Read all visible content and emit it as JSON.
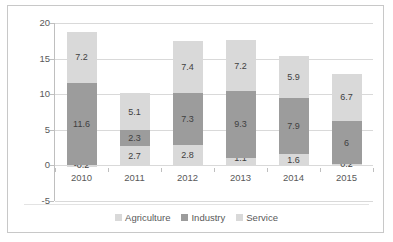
{
  "chart_data": {
    "type": "bar",
    "subtype": "stacked-column",
    "title": "",
    "xlabel": "",
    "ylabel": "",
    "categories": [
      "2010",
      "2011",
      "2012",
      "2013",
      "2014",
      "2015"
    ],
    "series": [
      {
        "name": "Agriculture",
        "color": "#d9d9d9",
        "values": [
          -0.2,
          2.7,
          2.8,
          1.1,
          1.6,
          0.2
        ]
      },
      {
        "name": "Industry",
        "color": "#9c9c9c",
        "values": [
          11.6,
          2.3,
          7.3,
          9.3,
          7.9,
          6.0
        ]
      },
      {
        "name": "Service",
        "color": "#d9d9d9",
        "values": [
          7.2,
          5.1,
          7.4,
          7.2,
          5.9,
          6.7
        ]
      }
    ],
    "data_labels": {
      "2010": {
        "Agriculture": "-0.2",
        "Industry": "11.6",
        "Service": "7.2"
      },
      "2011": {
        "Agriculture": "2.7",
        "Industry": "2.3",
        "Service": "5.1"
      },
      "2012": {
        "Agriculture": "2.8",
        "Industry": "7.3",
        "Service": "7.4"
      },
      "2013": {
        "Agriculture": "1.1",
        "Industry": "9.3",
        "Service": "7.2"
      },
      "2014": {
        "Agriculture": "1.6",
        "Industry": "7.9",
        "Service": "5.9"
      },
      "2015": {
        "Agriculture": "0.2",
        "Industry": "6",
        "Service": "6.7"
      }
    },
    "ylim": [
      -5,
      20
    ],
    "yticks": [
      "20",
      "15",
      "10",
      "5",
      "0",
      "-5"
    ],
    "ytick_values": [
      20,
      15,
      10,
      5,
      0,
      -5
    ],
    "grid": true,
    "legend_position": "bottom",
    "legend": [
      "Agriculture",
      "Industry",
      "Service"
    ]
  },
  "colors": {
    "light": "#d9d9d9",
    "dark": "#9c9c9c",
    "grid": "#d9d9d9",
    "axis": "#bfbfbf",
    "frame": "#c8c8c8",
    "text": "#595959",
    "label_text": "#3f3f3f"
  }
}
